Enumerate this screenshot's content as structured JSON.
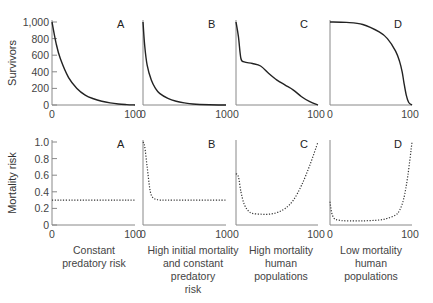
{
  "chart_data": [
    {
      "type": "line",
      "panel": "A",
      "row": "survivorship",
      "ylabel": "Survivors",
      "xlabel": "",
      "xlim": [
        0,
        100
      ],
      "ylim": [
        0,
        1000
      ],
      "yticks": [
        "0",
        "200",
        "400",
        "600",
        "800",
        "1,000"
      ],
      "xticks": [
        "0",
        "100"
      ],
      "x": [
        0,
        5,
        10,
        20,
        30,
        40,
        50,
        60,
        70,
        80,
        90,
        100
      ],
      "values": [
        1000,
        740,
        560,
        330,
        200,
        120,
        75,
        45,
        25,
        12,
        5,
        0
      ],
      "style": "solid"
    },
    {
      "type": "line",
      "panel": "B",
      "row": "survivorship",
      "xlim": [
        0,
        100
      ],
      "ylim": [
        0,
        1000
      ],
      "xticks": [
        "0",
        "100"
      ],
      "x": [
        0,
        2,
        5,
        10,
        15,
        20,
        30,
        40,
        50,
        60,
        80,
        100
      ],
      "values": [
        1000,
        720,
        480,
        300,
        200,
        140,
        80,
        45,
        25,
        12,
        3,
        0
      ],
      "style": "solid"
    },
    {
      "type": "line",
      "panel": "C",
      "row": "survivorship",
      "xlim": [
        0,
        100
      ],
      "ylim": [
        0,
        1000
      ],
      "xticks": [
        "0",
        "100"
      ],
      "x": [
        0,
        3,
        6,
        10,
        20,
        30,
        40,
        50,
        60,
        70,
        80,
        90,
        100
      ],
      "values": [
        1000,
        820,
        560,
        520,
        500,
        470,
        380,
        300,
        240,
        180,
        100,
        40,
        0
      ],
      "style": "solid"
    },
    {
      "type": "line",
      "panel": "D",
      "row": "survivorship",
      "xlim": [
        0,
        100
      ],
      "ylim": [
        0,
        1000
      ],
      "xticks": [
        "0",
        "100"
      ],
      "x": [
        0,
        20,
        40,
        60,
        70,
        80,
        85,
        88,
        90,
        93,
        96,
        100
      ],
      "values": [
        1000,
        995,
        970,
        880,
        800,
        650,
        520,
        400,
        280,
        120,
        30,
        0
      ],
      "style": "solid"
    },
    {
      "type": "line",
      "panel": "A",
      "row": "mortality",
      "ylabel": "Mortality risk",
      "xlabel": "Constant predatory risk",
      "xlim": [
        0,
        100
      ],
      "ylim": [
        0,
        1.0
      ],
      "yticks": [
        "0",
        "0.2",
        "0.4",
        "0.6",
        "0.8",
        "1.0"
      ],
      "xticks": [
        "0",
        "100"
      ],
      "x": [
        0,
        100
      ],
      "values": [
        0.3,
        0.3
      ],
      "style": "dotted"
    },
    {
      "type": "line",
      "panel": "B",
      "row": "mortality",
      "xlabel": "High initial mortality and constant predatory risk",
      "xlim": [
        0,
        100
      ],
      "ylim": [
        0,
        1.0
      ],
      "xticks": [
        "0",
        "100"
      ],
      "x": [
        0,
        2,
        5,
        8,
        10,
        13,
        16,
        20,
        30,
        100
      ],
      "values": [
        1.0,
        0.95,
        0.7,
        0.45,
        0.36,
        0.32,
        0.31,
        0.3,
        0.3,
        0.3
      ],
      "style": "dotted"
    },
    {
      "type": "line",
      "panel": "C",
      "row": "mortality",
      "xlabel": "High mortality human populations",
      "xlim": [
        0,
        100
      ],
      "ylim": [
        0,
        1.0
      ],
      "xticks": [
        "0",
        "100"
      ],
      "x": [
        0,
        3,
        6,
        10,
        15,
        20,
        30,
        40,
        50,
        60,
        70,
        80,
        90,
        100
      ],
      "values": [
        0.62,
        0.58,
        0.4,
        0.25,
        0.17,
        0.14,
        0.13,
        0.13,
        0.15,
        0.2,
        0.3,
        0.48,
        0.72,
        1.0
      ],
      "style": "dotted"
    },
    {
      "type": "line",
      "panel": "D",
      "row": "mortality",
      "xlabel": "Low mortality human populations",
      "xlim": [
        0,
        100
      ],
      "ylim": [
        0,
        1.0
      ],
      "xticks": [
        "0",
        "100"
      ],
      "x": [
        0,
        2,
        5,
        10,
        20,
        40,
        60,
        70,
        80,
        85,
        90,
        95,
        100
      ],
      "values": [
        0.28,
        0.15,
        0.08,
        0.06,
        0.05,
        0.05,
        0.06,
        0.08,
        0.12,
        0.18,
        0.32,
        0.6,
        1.0
      ],
      "style": "dotted"
    }
  ],
  "labels": {
    "survivors_axis": "Survivors",
    "mortality_axis": "Mortality risk",
    "panels": [
      "A",
      "B",
      "C",
      "D"
    ],
    "top_yticks": [
      "1,000",
      "800",
      "600",
      "400",
      "200",
      "0"
    ],
    "bottom_yticks": [
      "1.0",
      "0.8",
      "0.6",
      "0.4",
      "0.2",
      "0"
    ],
    "x_min": "0",
    "x_max": "100",
    "captions": [
      "Constant\npredatory risk",
      "High initial mortality\nand constant\npredatory\nrisk",
      "High mortality\nhuman\npopulations",
      "Low mortality\nhuman\npopulations"
    ]
  }
}
